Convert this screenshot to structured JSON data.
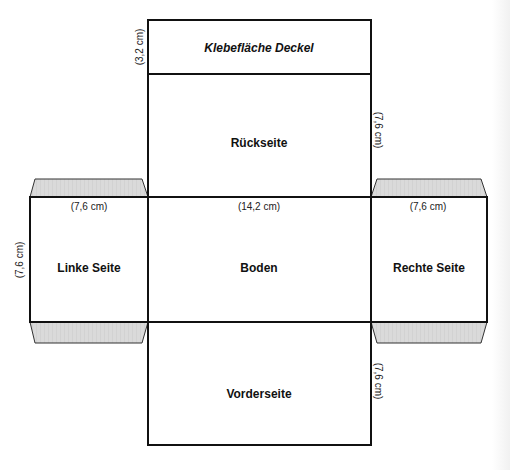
{
  "diagram": {
    "type": "box-net",
    "colors": {
      "line": "#111111",
      "tab_fill": "#d9d9d9",
      "background": "#ffffff"
    },
    "panels": {
      "lid_flap": {
        "label": "Klebefläche Deckel",
        "dimension": "(3,2 cm)"
      },
      "back": {
        "label": "Rückseite",
        "dimension": "(7,6 cm)"
      },
      "left": {
        "label": "Linke Seite",
        "dimension_top": "(7,6 cm)",
        "dimension_side": "(7,6 cm)"
      },
      "bottom": {
        "label": "Boden",
        "dimension_top": "(14,2 cm)"
      },
      "right": {
        "label": "Rechte Seite",
        "dimension_top": "(7,6 cm)"
      },
      "front": {
        "label": "Vorderseite",
        "dimension": "(7,6 cm)"
      }
    }
  }
}
